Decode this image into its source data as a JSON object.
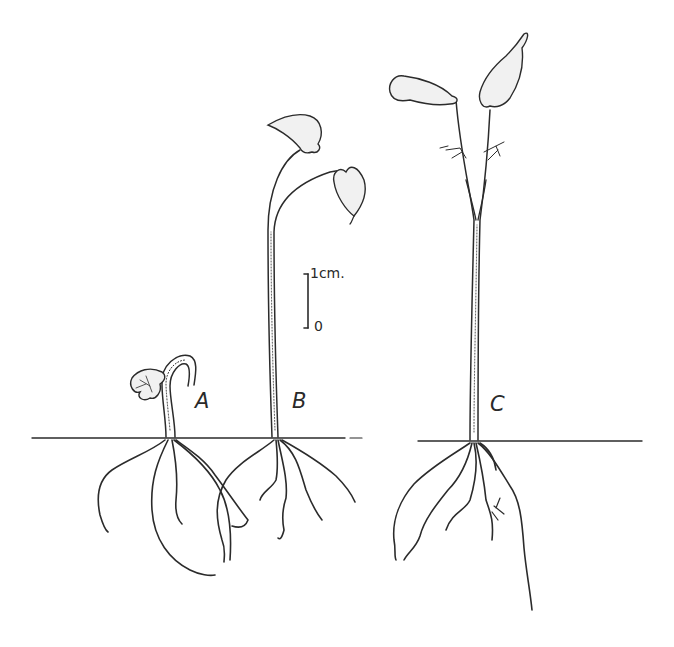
{
  "figure": {
    "scale_bar": {
      "top_label": "1cm.",
      "bottom_label": "0"
    },
    "specimens": [
      {
        "id": "A",
        "label": "A",
        "stage": "hooked hypocotyl, cotyledons emerging"
      },
      {
        "id": "B",
        "label": "B",
        "stage": "straightened stem with two leaves"
      },
      {
        "id": "C",
        "label": "C",
        "stage": "tall stem with two leaves and small secondary leaflets"
      }
    ],
    "signature": "H"
  }
}
